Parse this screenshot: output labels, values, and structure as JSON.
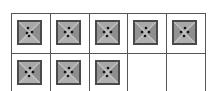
{
  "grid": {
    "columns": 5,
    "rows": 2,
    "cells": [
      {
        "filled": true,
        "icon": "four-dot-tile-icon",
        "dots": "diamond-rotated"
      },
      {
        "filled": true,
        "icon": "four-dot-tile-icon",
        "dots": "diamond"
      },
      {
        "filled": true,
        "icon": "four-dot-tile-icon",
        "dots": "diamond"
      },
      {
        "filled": true,
        "icon": "four-dot-tile-icon",
        "dots": "diamond"
      },
      {
        "filled": true,
        "icon": "four-dot-tile-icon",
        "dots": "diamond"
      },
      {
        "filled": true,
        "icon": "four-dot-tile-icon",
        "dots": "diamond"
      },
      {
        "filled": true,
        "icon": "four-dot-tile-icon",
        "dots": "diamond"
      },
      {
        "filled": true,
        "icon": "four-dot-tile-icon",
        "dots": "diamond"
      },
      {
        "filled": false
      },
      {
        "filled": false
      }
    ],
    "filled_count": 8,
    "total_count": 10
  },
  "colors": {
    "tile_fill": "#9c9c9c",
    "tile_border": "#4a4a4a",
    "tile_highlight": "#c8c8c8",
    "dot": "#111111",
    "grid_line": "#555555"
  }
}
